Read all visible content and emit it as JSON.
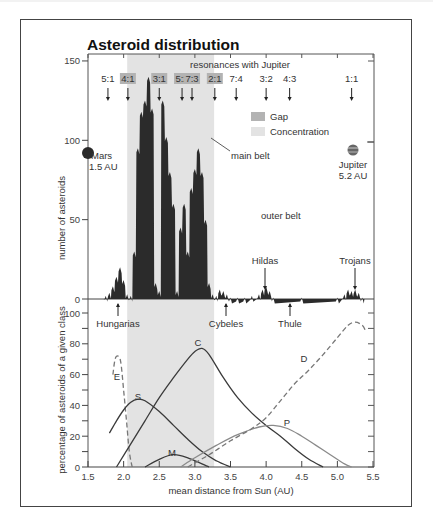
{
  "chart_data": [
    {
      "type": "bar",
      "title": "Asteroid distribution",
      "subtitle": "resonances with Jupiter",
      "xlabel": "",
      "ylabel": "number of asteroids",
      "xlim": [
        1.5,
        5.5
      ],
      "ylim": [
        0,
        150
      ],
      "yticks": [
        "0",
        "50",
        "100",
        "150"
      ],
      "grid": false,
      "legend": {
        "position": "upper-middle",
        "entries": [
          {
            "label": "Gap",
            "color": "#b3b3b3"
          },
          {
            "label": "Concentration",
            "color": "#e3e3e3"
          }
        ]
      },
      "concentration_region": [
        2.05,
        3.27
      ],
      "resonances": [
        {
          "label": "5:1",
          "x": 1.78,
          "gap": false
        },
        {
          "label": "4:1",
          "x": 2.06,
          "gap": true
        },
        {
          "label": "3:1",
          "x": 2.5,
          "gap": true
        },
        {
          "label": "5:2",
          "x": 2.82,
          "gap": true
        },
        {
          "label": "7:3",
          "x": 2.96,
          "gap": true
        },
        {
          "label": "2:1",
          "x": 3.28,
          "gap": true
        },
        {
          "label": "7:4",
          "x": 3.58,
          "gap": false
        },
        {
          "label": "3:2",
          "x": 4.0,
          "gap": false
        },
        {
          "label": "4:3",
          "x": 4.33,
          "gap": false
        },
        {
          "label": "1:1",
          "x": 5.2,
          "gap": false
        }
      ],
      "histogram": {
        "x": [
          1.75,
          1.8,
          1.85,
          1.9,
          1.95,
          2.0,
          2.05,
          2.1,
          2.15,
          2.2,
          2.25,
          2.3,
          2.35,
          2.4,
          2.45,
          2.5,
          2.55,
          2.6,
          2.65,
          2.7,
          2.75,
          2.8,
          2.85,
          2.9,
          2.95,
          3.0,
          3.05,
          3.1,
          3.15,
          3.2,
          3.25,
          3.3,
          3.35,
          3.4,
          3.45,
          3.5,
          3.6,
          3.7,
          3.8,
          3.9,
          3.95,
          4.0,
          4.05,
          4.1,
          4.5,
          5.0,
          5.1,
          5.15,
          5.2,
          5.25,
          5.3,
          5.35
        ],
        "values": [
          2,
          4,
          8,
          14,
          20,
          12,
          3,
          2,
          30,
          95,
          118,
          125,
          140,
          120,
          10,
          5,
          125,
          102,
          80,
          60,
          5,
          45,
          60,
          30,
          70,
          82,
          95,
          80,
          50,
          10,
          3,
          2,
          6,
          5,
          3,
          1,
          1,
          1,
          2,
          3,
          6,
          8,
          5,
          1,
          1,
          1,
          3,
          6,
          5,
          6,
          4,
          1
        ]
      },
      "annotations": [
        {
          "text": "Mars",
          "sub": "1.5 AU"
        },
        {
          "text": "Jupiter",
          "sub": "5.2 AU"
        },
        {
          "text": "main belt"
        },
        {
          "text": "outer belt"
        },
        {
          "text": "Hildas",
          "x": 4.0,
          "arrow": "down"
        },
        {
          "text": "Trojans",
          "x": 5.2,
          "arrow": "down"
        },
        {
          "text": "Hungarias",
          "x": 1.95,
          "arrow": "up"
        },
        {
          "text": "Cybeles",
          "x": 3.45,
          "arrow": "up"
        },
        {
          "text": "Thule",
          "x": 4.27,
          "arrow": "up"
        }
      ]
    },
    {
      "type": "line",
      "title": "",
      "xlabel": "mean distance from Sun (AU)",
      "ylabel": "percentage of asteroids of a given class",
      "xlim": [
        1.5,
        5.5
      ],
      "ylim": [
        0,
        100
      ],
      "xticks": [
        "1.5",
        "2.0",
        "2.5",
        "3.0",
        "3.5",
        "4.0",
        "4.5",
        "5.0",
        "5.5"
      ],
      "yticks": [
        "0",
        "20",
        "40",
        "60",
        "80",
        "100"
      ],
      "grid": false,
      "series": [
        {
          "name": "E",
          "style": "dashed",
          "x": [
            1.85,
            1.88,
            1.92,
            1.96,
            2.0,
            2.04,
            2.08,
            2.12
          ],
          "values": [
            60,
            70,
            72,
            68,
            50,
            30,
            10,
            0
          ]
        },
        {
          "name": "S",
          "style": "solid",
          "x": [
            1.8,
            1.9,
            2.0,
            2.1,
            2.2,
            2.3,
            2.5,
            2.7,
            2.9,
            3.1,
            3.3,
            3.5
          ],
          "values": [
            22,
            30,
            37,
            42,
            44,
            43,
            36,
            27,
            18,
            10,
            4,
            0
          ]
        },
        {
          "name": "C",
          "style": "solid",
          "x": [
            1.9,
            2.1,
            2.3,
            2.5,
            2.7,
            2.9,
            3.0,
            3.1,
            3.2,
            3.4,
            3.6,
            3.8,
            4.0,
            4.2,
            4.4,
            4.6,
            4.8
          ],
          "values": [
            0,
            15,
            30,
            45,
            58,
            70,
            75,
            77,
            73,
            58,
            45,
            35,
            27,
            20,
            12,
            5,
            0
          ]
        },
        {
          "name": "M",
          "style": "solid",
          "x": [
            2.3,
            2.5,
            2.7,
            2.9,
            3.1,
            3.2
          ],
          "values": [
            0,
            5,
            8,
            6,
            2,
            0
          ]
        },
        {
          "name": "P",
          "style": "solid-gray",
          "x": [
            2.8,
            3.0,
            3.3,
            3.6,
            3.9,
            4.1,
            4.3,
            4.5,
            4.7,
            4.9,
            5.1,
            5.2
          ],
          "values": [
            0,
            6,
            14,
            21,
            26,
            27,
            25,
            20,
            14,
            8,
            2,
            0
          ]
        },
        {
          "name": "D",
          "style": "dashed",
          "x": [
            2.9,
            3.2,
            3.5,
            3.8,
            4.0,
            4.2,
            4.4,
            4.6,
            4.8,
            5.0,
            5.15,
            5.25,
            5.35,
            5.4
          ],
          "values": [
            0,
            8,
            17,
            25,
            32,
            43,
            54,
            63,
            73,
            84,
            92,
            94,
            92,
            88
          ]
        }
      ],
      "reference_markers": [
        "Hungarias",
        "Cybeles",
        "Thule"
      ]
    }
  ],
  "labels": {
    "title": "Asteroid distribution",
    "subtitle": "resonances with Jupiter",
    "ylabel_top": "number of asteroids",
    "ylabel_bottom": "percentage of asteroids of a given class",
    "xlabel": "mean distance from Sun (AU)",
    "legend_gap": "Gap",
    "legend_concentration": "Concentration",
    "mars": "Mars",
    "mars_au": "1.5 AU",
    "jupiter": "Jupiter",
    "jupiter_au": "5.2 AU",
    "main_belt": "main belt",
    "outer_belt": "outer belt",
    "hildas": "Hildas",
    "trojans": "Trojans",
    "hungarias": "Hungarias",
    "cybeles": "Cybeles",
    "thule": "Thule",
    "E": "E",
    "S": "S",
    "C": "C",
    "M": "M",
    "P": "P",
    "D": "D"
  },
  "colors": {
    "histogram": "#2b2b2b",
    "concentration": "#e3e3e3",
    "gap": "#b3b3b3",
    "axis": "#444444",
    "curve_dark": "#3a3a3a",
    "curve_gray": "#8a8a8a"
  }
}
